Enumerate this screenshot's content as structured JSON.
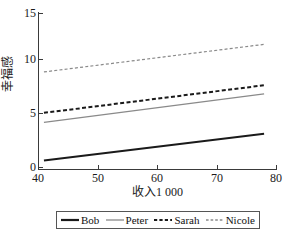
{
  "chart_data": {
    "type": "line",
    "title": "",
    "xlabel": "收入1 000",
    "ylabel": "幸福感",
    "xlim": [
      40,
      80
    ],
    "ylim": [
      -1.5,
      15
    ],
    "x_ticks": [
      40,
      50,
      60,
      70,
      80
    ],
    "y_ticks": [
      0,
      5,
      10,
      15
    ],
    "grid": false,
    "legend_position": "below",
    "x": [
      41,
      78
    ],
    "series": [
      {
        "name": "Bob",
        "values": [
          -0.6,
          2.2
        ],
        "color": "#1a1a1a",
        "style": "solid",
        "width": 2.0
      },
      {
        "name": "Peter",
        "values": [
          3.4,
          6.4
        ],
        "color": "#8a8a8a",
        "style": "solid",
        "width": 1.2
      },
      {
        "name": "Sarah",
        "values": [
          4.4,
          7.3
        ],
        "color": "#1a1a1a",
        "style": "dashed",
        "width": 2.0
      },
      {
        "name": "Nicole",
        "values": [
          8.7,
          11.6
        ],
        "color": "#8a8a8a",
        "style": "dashed",
        "width": 1.2
      }
    ]
  },
  "axes": {
    "y_tick_labels": [
      "0",
      "5",
      "10",
      "15"
    ],
    "x_tick_labels": [
      "40",
      "50",
      "60",
      "70",
      "80"
    ],
    "ylabel": "幸福感",
    "xlabel": "收入1 000"
  },
  "legend": {
    "entries": [
      {
        "label": "Bob"
      },
      {
        "label": "Peter"
      },
      {
        "label": "Sarah"
      },
      {
        "label": "Nicole"
      }
    ]
  }
}
